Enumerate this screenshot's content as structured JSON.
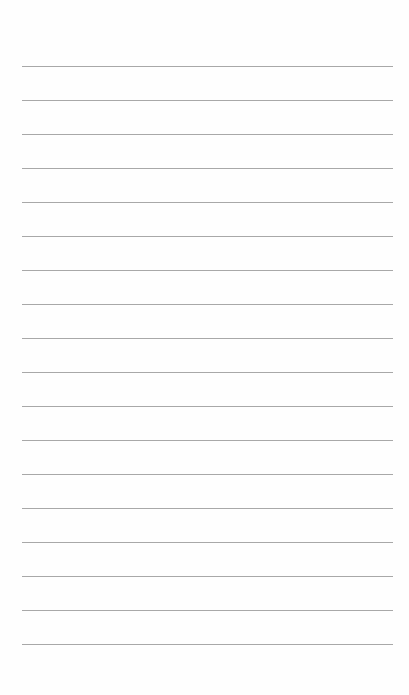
{
  "page": {
    "type": "lined-paper",
    "background": "#fefefe",
    "rule_color": "#a8a8a8",
    "rule_count": 18,
    "first_rule_y": 66,
    "rule_spacing": 34,
    "rule_left": 22,
    "rule_width": 371
  }
}
